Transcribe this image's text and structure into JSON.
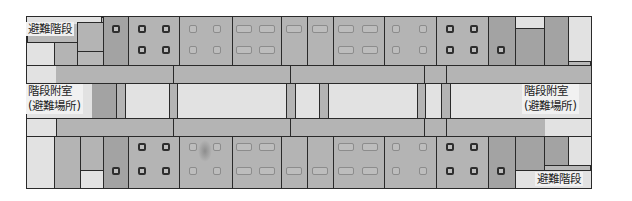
{
  "diagram": {
    "type": "floor-plan",
    "labels": {
      "stair_top_left": "避難階段",
      "stair_bottom_right": "避難階段",
      "annex_left_line1": "階段附室",
      "annex_left_line2": "(避難場所)",
      "annex_right_line1": "階段附室",
      "annex_right_line2": "(避難場所)"
    },
    "colors": {
      "wall": "#2a2a2a",
      "room_fill": "#b4b4b4",
      "hall_fill": "#e2e2e2",
      "label_bg": "#f1f1f1"
    },
    "zones": [
      {
        "name": "evacuation-stair",
        "label": "避難階段",
        "count": 2
      },
      {
        "name": "stair-annex-refuge",
        "label": "階段附室(避難場所)",
        "count": 2
      },
      {
        "name": "upper-rooms-band"
      },
      {
        "name": "central-hall"
      },
      {
        "name": "lower-rooms-band"
      }
    ]
  }
}
